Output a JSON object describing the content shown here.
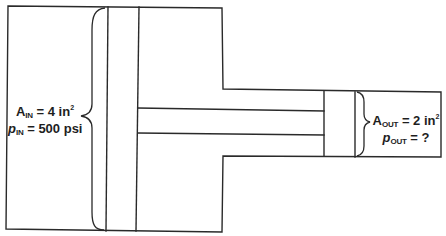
{
  "diagram": {
    "input_side": {
      "area_symbol": "A",
      "area_sub": "IN",
      "area_value": "= 4 in",
      "area_exp": "2",
      "pressure_symbol": "p",
      "pressure_sub": "IN",
      "pressure_value": "= 500 psi"
    },
    "output_side": {
      "area_symbol": "A",
      "area_sub": "OUT",
      "area_value": "= 2 in",
      "area_exp": "2",
      "pressure_symbol": "p",
      "pressure_sub": "OUT",
      "pressure_value": "= ?"
    },
    "components": [
      "large-cylinder",
      "large-piston",
      "connecting-rod",
      "small-cylinder",
      "small-piston",
      "input-area-brace",
      "output-area-brace"
    ],
    "colors": {
      "line": "#2a2a2a",
      "background": "#ffffff",
      "text": "#1e1e1e"
    }
  }
}
